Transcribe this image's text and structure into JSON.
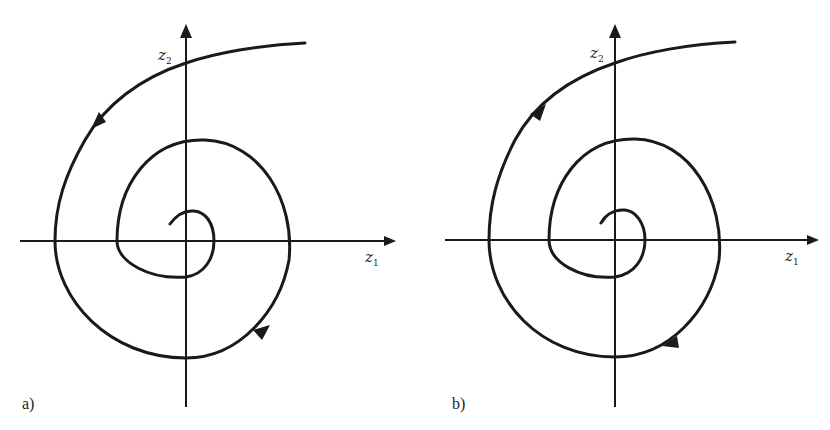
{
  "figure": {
    "panels": [
      {
        "id": "a",
        "label": "a)",
        "x_axis": {
          "name": "z",
          "subscript": "1"
        },
        "y_axis": {
          "name": "z",
          "subscript": "2"
        },
        "trajectory": "spiral",
        "direction": "inward (clockwise-to-origin)",
        "description": "Trajectory spirals toward the origin (stable focus)"
      },
      {
        "id": "b",
        "label": "b)",
        "x_axis": {
          "name": "z",
          "subscript": "1"
        },
        "y_axis": {
          "name": "z",
          "subscript": "2"
        },
        "trajectory": "spiral",
        "direction": "outward (away from origin)",
        "description": "Trajectory spirals away from the origin (unstable focus)"
      }
    ]
  }
}
